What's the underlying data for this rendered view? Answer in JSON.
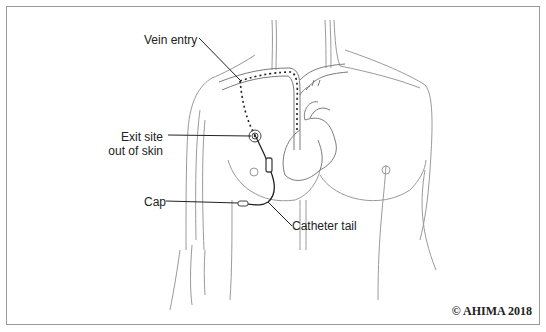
{
  "diagram": {
    "labels": {
      "vein_entry": "Vein entry",
      "exit_site_line1": "Exit site",
      "exit_site_line2": "out of skin",
      "cap": "Cap",
      "catheter_tail": "Catheter tail"
    },
    "copyright": "© AHIMA 2018",
    "colors": {
      "outline": "#8a8a8a",
      "dark_line": "#222222",
      "border": "#9a9a9a",
      "background": "#ffffff"
    }
  }
}
